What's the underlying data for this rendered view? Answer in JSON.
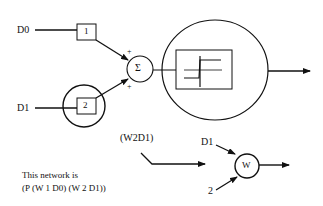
{
  "diagram": {
    "inputs": {
      "d0": "D0",
      "d1": "D1"
    },
    "weights": {
      "w1": "1",
      "w2": "2"
    },
    "summation": {
      "symbol": "Σ",
      "plus_top": "+",
      "plus_bottom": "+"
    },
    "threshold_function": "step-function",
    "subexpression_label": "(W2D1)",
    "w_node": {
      "symbol": "W",
      "input_top": "D1",
      "input_bottom": "2"
    },
    "caption": {
      "line1": "This network is",
      "line2": "(P (W 1 D0) (W 2 D1))"
    }
  }
}
